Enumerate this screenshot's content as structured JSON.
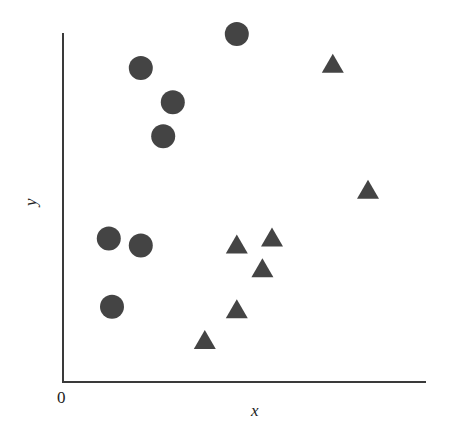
{
  "chart_data": {
    "type": "scatter",
    "title": "",
    "xlabel": "x",
    "ylabel": "y",
    "origin_label": "0",
    "grid": false,
    "legend": null,
    "xlim": [
      0,
      10
    ],
    "ylim": [
      0,
      10
    ],
    "colors": {
      "marker": "#444444",
      "axis": "#3a3a3a"
    },
    "series": [
      {
        "name": "circles",
        "marker": "circle",
        "points": [
          {
            "x": 1.9,
            "y": 9.0
          },
          {
            "x": 2.9,
            "y": 8.0
          },
          {
            "x": 2.6,
            "y": 7.0
          },
          {
            "x": 4.9,
            "y": 10.0
          },
          {
            "x": 0.9,
            "y": 4.0
          },
          {
            "x": 1.9,
            "y": 3.8
          },
          {
            "x": 1.0,
            "y": 2.0
          }
        ]
      },
      {
        "name": "triangles",
        "marker": "triangle",
        "points": [
          {
            "x": 7.9,
            "y": 9.1
          },
          {
            "x": 9.0,
            "y": 5.4
          },
          {
            "x": 4.9,
            "y": 3.8
          },
          {
            "x": 6.0,
            "y": 4.0
          },
          {
            "x": 5.7,
            "y": 3.1
          },
          {
            "x": 4.9,
            "y": 1.9
          },
          {
            "x": 3.9,
            "y": 1.0
          }
        ]
      }
    ]
  }
}
